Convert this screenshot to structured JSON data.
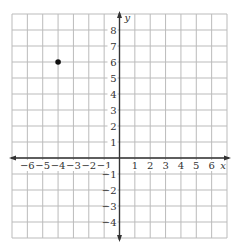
{
  "chart_data": {
    "type": "scatter",
    "title": "",
    "xlabel": "x",
    "ylabel": "y",
    "xlim": [
      -7,
      7
    ],
    "ylim": [
      -5,
      9
    ],
    "grid": true,
    "x_ticks": [
      -6,
      -5,
      -4,
      -3,
      -2,
      -1,
      1,
      2,
      3,
      4,
      5,
      6
    ],
    "y_ticks": [
      8,
      7,
      6,
      5,
      4,
      3,
      2,
      1,
      -1,
      -2,
      -3,
      -4
    ],
    "points": [
      {
        "x": -4,
        "y": 6
      }
    ],
    "colors": {
      "grid": "#bbbbbb",
      "axis": "#333333",
      "point": "#111111"
    }
  }
}
